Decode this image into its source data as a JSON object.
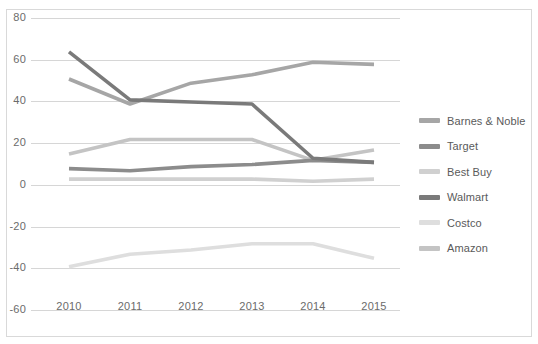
{
  "chart_data": {
    "type": "line",
    "title": "",
    "xlabel": "",
    "ylabel": "",
    "categories": [
      "2010",
      "2011",
      "2012",
      "2013",
      "2014",
      "2015"
    ],
    "x": [
      2010,
      2011,
      2012,
      2013,
      2014,
      2015
    ],
    "ylim": [
      -60,
      80
    ],
    "yticks": [
      80,
      60,
      40,
      20,
      0,
      -20,
      -40,
      -60
    ],
    "ytick_labels": [
      "80",
      "60",
      "40",
      "20",
      "0",
      "-20",
      "-40",
      "-60"
    ],
    "grid": true,
    "legend_position": "right",
    "series": [
      {
        "name": "Barnes & Noble",
        "color": "#a6a6a6",
        "values": [
          51,
          39,
          49,
          53,
          59,
          58
        ]
      },
      {
        "name": "Target",
        "color": "#8c8c8c",
        "values": [
          8,
          7,
          9,
          10,
          12,
          11
        ]
      },
      {
        "name": "Best Buy",
        "color": "#d0d0d0",
        "values": [
          3,
          3,
          3,
          3,
          2,
          3
        ]
      },
      {
        "name": "Walmart",
        "color": "#7a7a7a",
        "values": [
          64,
          41,
          40,
          39,
          13,
          11
        ]
      },
      {
        "name": "Costco",
        "color": "#dedede",
        "values": [
          -39,
          -33,
          -31,
          -28,
          -28,
          -35
        ]
      },
      {
        "name": "Amazon",
        "color": "#c4c4c4",
        "values": [
          15,
          22,
          22,
          22,
          12,
          17
        ]
      }
    ]
  },
  "legend": {
    "items": [
      {
        "label": "Barnes & Noble"
      },
      {
        "label": "Target"
      },
      {
        "label": "Best Buy"
      },
      {
        "label": "Walmart"
      },
      {
        "label": "Costco"
      },
      {
        "label": "Amazon"
      }
    ]
  },
  "axes": {
    "y_ticks": [
      {
        "label": "80"
      },
      {
        "label": "60"
      },
      {
        "label": "40"
      },
      {
        "label": "20"
      },
      {
        "label": "0"
      },
      {
        "label": "-20"
      },
      {
        "label": "-40"
      },
      {
        "label": "-60"
      }
    ],
    "x_ticks": [
      {
        "label": "2010"
      },
      {
        "label": "2011"
      },
      {
        "label": "2012"
      },
      {
        "label": "2013"
      },
      {
        "label": "2014"
      },
      {
        "label": "2015"
      }
    ]
  },
  "colors": {
    "grid": "#d6d6d6",
    "border": "#d9d9d9",
    "text": "#6b6b6b",
    "background": "#ffffff"
  }
}
